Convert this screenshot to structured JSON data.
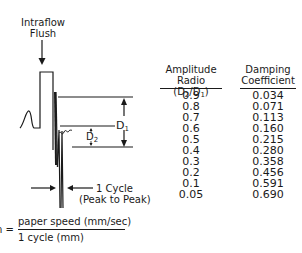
{
  "diagram": {
    "flush_label_line1": "Intraflow",
    "flush_label_line2": "Flush",
    "d1_label": "D",
    "d1_sub": "1",
    "d2_label": "D",
    "d2_sub": "2",
    "cycle_label_line1": "1 Cycle",
    "cycle_label_line2": "(Peak to Peak)"
  },
  "table": {
    "headers": {
      "amplitude_line1": "Amplitude",
      "amplitude_line2_prefix": "Radio (D",
      "amplitude_sub2": "2",
      "amplitude_mid": "/D",
      "amplitude_sub1": "1",
      "amplitude_suffix": ")",
      "damping_line1": "Damping",
      "damping_line2": "Coefficient"
    },
    "rows": [
      {
        "amplitude_ratio": "0.9",
        "damping_coefficient": "0.034"
      },
      {
        "amplitude_ratio": "0.8",
        "damping_coefficient": "0.071"
      },
      {
        "amplitude_ratio": "0.7",
        "damping_coefficient": "0.113"
      },
      {
        "amplitude_ratio": "0.6",
        "damping_coefficient": "0.160"
      },
      {
        "amplitude_ratio": "0.5",
        "damping_coefficient": "0.215"
      },
      {
        "amplitude_ratio": "0.4",
        "damping_coefficient": "0.280"
      },
      {
        "amplitude_ratio": "0.3",
        "damping_coefficient": "0.358"
      },
      {
        "amplitude_ratio": "0.2",
        "damping_coefficient": "0.456"
      },
      {
        "amplitude_ratio": "0.1",
        "damping_coefficient": "0.591"
      },
      {
        "amplitude_ratio": "0.05",
        "damping_coefficient": "0.690"
      }
    ]
  },
  "formula": {
    "lhs": "n =",
    "numerator": "paper speed (mm/sec)",
    "denominator": "1 cycle (mm)"
  }
}
